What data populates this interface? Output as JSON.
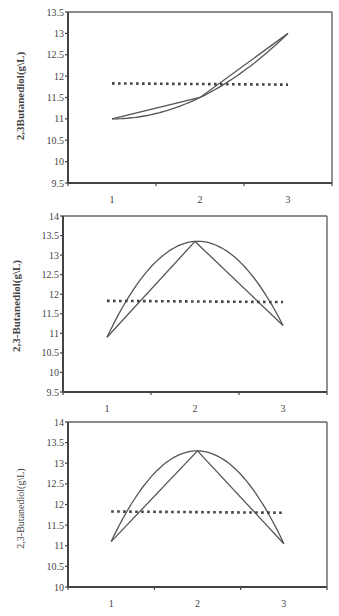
{
  "chart_data": [
    {
      "type": "line",
      "title": "",
      "xlabel": "",
      "ylabel": "2,3Butanediol(g\\L)",
      "ylim": [
        9.5,
        13.5
      ],
      "yticks": [
        "9.5",
        "10",
        "10.5",
        "11",
        "11.5",
        "12",
        "12.5",
        "13",
        "13.5"
      ],
      "categories": [
        "1",
        "2",
        "3"
      ],
      "grid": false,
      "legend": "none",
      "series": [
        {
          "name": "observed (polyline)",
          "style": "solid",
          "values": [
            11.0,
            11.5,
            13.0
          ]
        },
        {
          "name": "fitted curve",
          "style": "solid-smooth",
          "values": [
            11.0,
            11.5,
            13.0
          ]
        },
        {
          "name": "mean",
          "style": "dotted",
          "values": [
            11.83,
            11.81,
            11.8
          ]
        }
      ],
      "frame": {
        "top": 12,
        "bottom": 183,
        "left": 68,
        "right": 332
      }
    },
    {
      "type": "line",
      "title": "",
      "xlabel": "",
      "ylabel": "2,3-Butanediol(g\\L)",
      "ylim": [
        9.5,
        14
      ],
      "yticks": [
        "9.5",
        "10",
        "10.5",
        "11",
        "11.5",
        "12",
        "12.5",
        "13",
        "13.5",
        "14"
      ],
      "categories": [
        "1",
        "2",
        "3"
      ],
      "grid": false,
      "legend": "none",
      "series": [
        {
          "name": "observed (polyline)",
          "style": "solid",
          "values": [
            10.9,
            13.35,
            11.2
          ]
        },
        {
          "name": "fitted curve",
          "style": "solid-smooth",
          "values": [
            10.9,
            13.35,
            11.2
          ]
        },
        {
          "name": "mean",
          "style": "dotted",
          "values": [
            11.83,
            11.81,
            11.8
          ]
        }
      ],
      "frame": {
        "top": 216,
        "bottom": 392,
        "left": 63,
        "right": 327
      }
    },
    {
      "type": "line",
      "title": "",
      "xlabel": "",
      "ylabel": "2,3-Butanediol(g\\L)",
      "ylim": [
        10,
        14
      ],
      "yticks": [
        "10",
        "10.5",
        "11",
        "11.5",
        "12",
        "12.5",
        "13",
        "13.5",
        "14"
      ],
      "categories": [
        "1",
        "2",
        "3"
      ],
      "grid": false,
      "legend": "none",
      "series": [
        {
          "name": "observed (polyline)",
          "style": "solid",
          "values": [
            11.1,
            13.3,
            11.05
          ]
        },
        {
          "name": "fitted curve",
          "style": "solid-smooth",
          "values": [
            11.1,
            13.3,
            11.05
          ]
        },
        {
          "name": "mean",
          "style": "dotted",
          "values": [
            11.83,
            11.81,
            11.8
          ]
        }
      ],
      "frame": {
        "top": 422,
        "bottom": 587,
        "left": 68,
        "right": 327
      }
    }
  ],
  "charts": [
    {
      "ylabel": "2,3Butanediol(g\\L)"
    },
    {
      "ylabel": "2,3-Butanediol(g\\L)"
    },
    {
      "ylabel": "2,3-Butanediol(g\\L)"
    }
  ],
  "colors": {
    "line": "#555555",
    "frame": "#666666",
    "axis": "#444444",
    "dots": "#444444"
  }
}
